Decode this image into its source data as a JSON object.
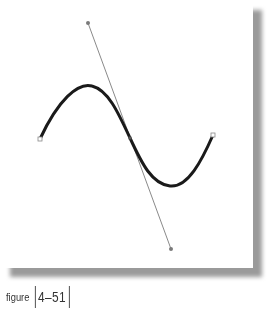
{
  "figure": {
    "caption_label": "figure",
    "caption_number": "4–51"
  },
  "diagram": {
    "type": "bezier-curve-with-tangent-handle",
    "curve": {
      "start": [
        40,
        139
      ],
      "mid_anchor": [
        130,
        138
      ],
      "end": [
        213,
        135
      ],
      "stroke_color": "#1a1a1a",
      "stroke_width": 3
    },
    "tangent_handle": {
      "top": [
        88,
        23
      ],
      "bottom": [
        171,
        249
      ],
      "stroke_color": "#8a8a8a"
    },
    "background_color": "#ffffff",
    "shadow_color": "#9a9a9a"
  }
}
